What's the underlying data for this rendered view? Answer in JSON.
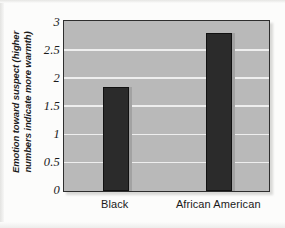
{
  "chart_data": {
    "type": "bar",
    "title": "",
    "subtitle": "",
    "xlabel": "",
    "ylabel": "Emotion toward suspect (higher numbers indicate more warmth)",
    "categories": [
      "Black",
      "African American"
    ],
    "values": [
      1.85,
      2.8
    ],
    "series": [
      {
        "name": "Emotion toward suspect",
        "values": [
          1.85,
          2.8
        ]
      }
    ],
    "ylim": [
      0,
      3
    ],
    "yticks": [
      "0",
      "0.5",
      "1",
      "1.5",
      "2",
      "2.5",
      "3"
    ],
    "ytick_values": [
      0,
      0.5,
      1,
      1.5,
      2,
      2.5,
      3
    ],
    "grid": true,
    "grid_axis": "y",
    "legend": false,
    "legend_position": "none",
    "colors": {
      "bar": "#2b2b2b",
      "bar_border": "#111111",
      "plot_background": "#b9b9b9",
      "gridline": "#eeeeee",
      "axis_frame": "#2e2e2e",
      "page_background": "#fcfcfb",
      "text": "#1a1a1a"
    }
  },
  "axis": {
    "y_title": "Emotion toward suspect (higher numbers indicate more warmth)",
    "y_title_line1": "Emotion toward suspect (higher",
    "y_title_line2": "numbers indicate more warmth)"
  }
}
